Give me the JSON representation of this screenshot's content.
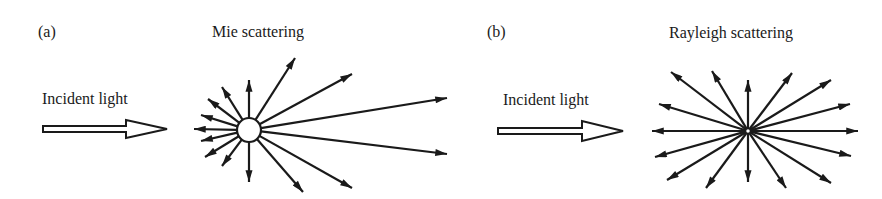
{
  "panels": [
    {
      "tag": "(a)",
      "title": "Mie scattering",
      "incident_label": "Incident light",
      "particle": {
        "cx": 249,
        "cy": 130,
        "r": 12,
        "size": "large"
      },
      "arrows": [
        [
          249,
          80
        ],
        [
          295,
          58
        ],
        [
          352,
          74
        ],
        [
          447,
          98
        ],
        [
          447,
          154
        ],
        [
          352,
          188
        ],
        [
          303,
          192
        ],
        [
          249,
          182
        ],
        [
          222,
          166
        ],
        [
          205,
          157
        ],
        [
          201,
          141
        ],
        [
          194,
          129
        ],
        [
          201,
          115
        ],
        [
          208,
          99
        ],
        [
          222,
          87
        ]
      ]
    },
    {
      "tag": "(b)",
      "title": "Rayleigh scattering",
      "incident_label": "Incident light",
      "particle": {
        "cx": 748,
        "cy": 131,
        "r": 2.5,
        "size": "small"
      },
      "arrows": [
        [
          671,
          72
        ],
        [
          712,
          71
        ],
        [
          748,
          80
        ],
        [
          792,
          73
        ],
        [
          831,
          80
        ],
        [
          850,
          104
        ],
        [
          858,
          131
        ],
        [
          851,
          156
        ],
        [
          831,
          183
        ],
        [
          786,
          188
        ],
        [
          748,
          182
        ],
        [
          706,
          188
        ],
        [
          667,
          180
        ],
        [
          655,
          157
        ],
        [
          652,
          131
        ],
        [
          659,
          104
        ]
      ]
    }
  ],
  "colors": {
    "ink": "#1a1a1a",
    "background": "#ffffff"
  }
}
